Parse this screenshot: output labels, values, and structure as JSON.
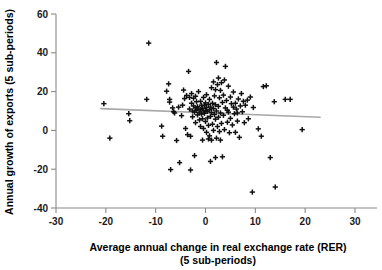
{
  "chart_data": {
    "type": "scatter",
    "title": "",
    "xlabel": "Average annual change in real exchange rate (RER)",
    "xlabel_line2": "(5 sub-periods)",
    "ylabel": "Annual growth of exports (5 sub-periods)",
    "xlim": [
      -30,
      30
    ],
    "ylim": [
      -40,
      60
    ],
    "xticks": [
      -30,
      -20,
      -10,
      0,
      10,
      20,
      30
    ],
    "yticks": [
      -40,
      -20,
      0,
      20,
      40,
      60
    ],
    "xtick_labels": [
      "-30",
      "-20",
      "-10",
      "0",
      "10",
      "20",
      "30"
    ],
    "ytick_labels": [
      "-40",
      "-20",
      "0",
      "20",
      "40",
      "60"
    ],
    "grid": false,
    "legend": false,
    "marker": "plus",
    "marker_color": "#111111",
    "trendline": {
      "type": "linear-fit",
      "color": "#a9a9a9",
      "x_start": -21.0,
      "y_start": 11.2,
      "x_end": 23.0,
      "y_end": 6.8
    },
    "points": [
      [
        -20.4,
        13.8
      ],
      [
        -19.2,
        -4.0
      ],
      [
        -15.4,
        8.6
      ],
      [
        -15.2,
        5.0
      ],
      [
        -11.8,
        16.0
      ],
      [
        -11.4,
        45.0
      ],
      [
        -8.8,
        2.2
      ],
      [
        -8.6,
        -3.0
      ],
      [
        -7.8,
        20.2
      ],
      [
        -7.4,
        24.0
      ],
      [
        -7.2,
        14.6
      ],
      [
        -7.2,
        16.0
      ],
      [
        -7.0,
        -20.2
      ],
      [
        -6.4,
        9.6
      ],
      [
        -6.2,
        9.0
      ],
      [
        -5.8,
        -5.2
      ],
      [
        -5.4,
        12.0
      ],
      [
        -5.2,
        -16.6
      ],
      [
        -4.8,
        7.6
      ],
      [
        -4.6,
        13.0
      ],
      [
        -4.2,
        16.4
      ],
      [
        -4.0,
        1.0
      ],
      [
        -3.8,
        18.0
      ],
      [
        -3.6,
        -2.2
      ],
      [
        -3.4,
        30.4
      ],
      [
        -3.2,
        17.0
      ],
      [
        -3.2,
        11.0
      ],
      [
        -3.0,
        -3.0
      ],
      [
        -3.0,
        -20.4
      ],
      [
        -2.8,
        19.0
      ],
      [
        -2.8,
        14.0
      ],
      [
        -2.6,
        10.0
      ],
      [
        -2.6,
        7.0
      ],
      [
        -2.4,
        16.6
      ],
      [
        -2.4,
        12.6
      ],
      [
        -2.2,
        9.4
      ],
      [
        -2.0,
        17.6
      ],
      [
        -2.0,
        11.6
      ],
      [
        -2.0,
        4.0
      ],
      [
        -1.8,
        14.8
      ],
      [
        -1.8,
        10.4
      ],
      [
        -1.6,
        12.2
      ],
      [
        -1.6,
        8.0
      ],
      [
        -1.4,
        20.0
      ],
      [
        -1.4,
        11.0
      ],
      [
        -1.2,
        9.0
      ],
      [
        -1.2,
        5.4
      ],
      [
        -1.0,
        15.0
      ],
      [
        -1.0,
        10.8
      ],
      [
        -1.0,
        2.0
      ],
      [
        -0.8,
        13.0
      ],
      [
        -0.8,
        8.4
      ],
      [
        -0.6,
        11.4
      ],
      [
        -0.6,
        6.0
      ],
      [
        -0.4,
        17.0
      ],
      [
        -0.4,
        10.0
      ],
      [
        -0.4,
        1.0
      ],
      [
        -0.2,
        12.8
      ],
      [
        -0.2,
        8.8
      ],
      [
        0.0,
        14.2
      ],
      [
        0.0,
        10.2
      ],
      [
        0.0,
        4.6
      ],
      [
        0.2,
        18.4
      ],
      [
        0.2,
        11.8
      ],
      [
        0.2,
        -1.0
      ],
      [
        0.4,
        9.8
      ],
      [
        0.4,
        6.4
      ],
      [
        0.6,
        13.4
      ],
      [
        0.6,
        2.6
      ],
      [
        0.8,
        16.0
      ],
      [
        0.8,
        10.6
      ],
      [
        0.8,
        -2.8
      ],
      [
        1.0,
        12.0
      ],
      [
        1.0,
        7.2
      ],
      [
        1.2,
        22.0
      ],
      [
        1.2,
        9.2
      ],
      [
        1.2,
        -5.0
      ],
      [
        1.4,
        14.0
      ],
      [
        1.4,
        3.2
      ],
      [
        1.6,
        25.0
      ],
      [
        1.6,
        11.2
      ],
      [
        1.6,
        0.0
      ],
      [
        1.8,
        17.8
      ],
      [
        1.8,
        8.2
      ],
      [
        2.0,
        21.0
      ],
      [
        2.0,
        13.2
      ],
      [
        2.0,
        5.8
      ],
      [
        2.2,
        35.0
      ],
      [
        2.2,
        10.0
      ],
      [
        2.2,
        -4.0
      ],
      [
        2.4,
        23.6
      ],
      [
        2.4,
        2.0
      ],
      [
        2.6,
        27.0
      ],
      [
        2.6,
        12.4
      ],
      [
        2.6,
        6.8
      ],
      [
        2.8,
        16.8
      ],
      [
        2.8,
        -0.6
      ],
      [
        3.0,
        20.6
      ],
      [
        3.0,
        9.0
      ],
      [
        3.2,
        24.6
      ],
      [
        3.2,
        3.6
      ],
      [
        3.4,
        14.4
      ],
      [
        3.4,
        -13.6
      ],
      [
        3.6,
        18.2
      ],
      [
        3.6,
        7.8
      ],
      [
        3.8,
        26.0
      ],
      [
        3.8,
        0.4
      ],
      [
        4.0,
        33.0
      ],
      [
        4.0,
        11.6
      ],
      [
        4.2,
        15.4
      ],
      [
        4.4,
        4.2
      ],
      [
        4.6,
        22.8
      ],
      [
        4.6,
        9.4
      ],
      [
        4.8,
        -1.2
      ],
      [
        5.0,
        17.2
      ],
      [
        5.0,
        6.2
      ],
      [
        5.2,
        13.8
      ],
      [
        5.4,
        2.8
      ],
      [
        5.6,
        19.8
      ],
      [
        5.8,
        8.6
      ],
      [
        6.0,
        14.0
      ],
      [
        6.0,
        -1.0
      ],
      [
        6.2,
        11.0
      ],
      [
        6.4,
        4.8
      ],
      [
        6.6,
        16.2
      ],
      [
        6.8,
        -3.6
      ],
      [
        7.0,
        12.6
      ],
      [
        7.2,
        19.0
      ],
      [
        7.4,
        9.6
      ],
      [
        7.6,
        15.0
      ],
      [
        8.0,
        13.0
      ],
      [
        8.4,
        15.6
      ],
      [
        8.6,
        6.0
      ],
      [
        9.0,
        17.2
      ],
      [
        9.4,
        -31.8
      ],
      [
        9.6,
        11.8
      ],
      [
        10.6,
        0.8
      ],
      [
        11.2,
        -3.0
      ],
      [
        11.6,
        22.6
      ],
      [
        12.2,
        23.0
      ],
      [
        13.0,
        -14.0
      ],
      [
        13.8,
        14.8
      ],
      [
        14.0,
        -29.2
      ],
      [
        16.0,
        16.0
      ],
      [
        17.0,
        16.0
      ],
      [
        19.4,
        0.4
      ],
      [
        -6.6,
        11.6
      ],
      [
        -4.4,
        20.8
      ],
      [
        -2.2,
        -13.0
      ],
      [
        1.0,
        -16.0
      ],
      [
        2.0,
        -14.0
      ],
      [
        4.4,
        10.4
      ],
      [
        5.6,
        12.0
      ],
      [
        6.4,
        9.0
      ],
      [
        7.8,
        4.0
      ],
      [
        -0.6,
        -5.0
      ],
      [
        0.6,
        -4.4
      ],
      [
        3.0,
        -5.0
      ]
    ]
  }
}
